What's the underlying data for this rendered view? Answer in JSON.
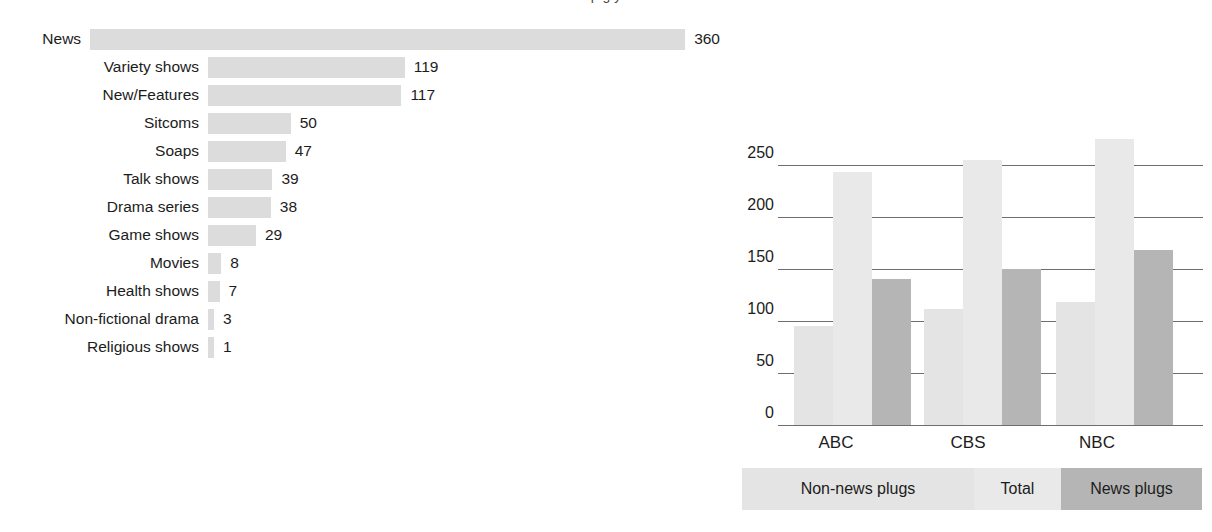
{
  "figure": {
    "cut_off_title": "p g y"
  },
  "chart_data": [
    {
      "type": "bar",
      "orientation": "horizontal",
      "title": "",
      "xlabel": "",
      "ylabel": "",
      "categories": [
        "News",
        "Variety shows",
        "New/Features",
        "Sitcoms",
        "Soaps",
        "Talk shows",
        "Drama series",
        "Game shows",
        "Movies",
        "Health shows",
        "Non-fictional drama",
        "Religious shows"
      ],
      "values": [
        360,
        119,
        117,
        50,
        47,
        39,
        38,
        29,
        8,
        7,
        3,
        1
      ],
      "value_labels": [
        "360",
        "119",
        "117",
        "50",
        "47",
        "39",
        "38",
        "29",
        "8",
        "7",
        "3",
        "1"
      ],
      "xlim": [
        0,
        360
      ],
      "grid": false,
      "bar_color": "#dcdcdc"
    },
    {
      "type": "bar",
      "orientation": "vertical",
      "grouped": true,
      "title": "",
      "xlabel": "",
      "ylabel": "",
      "categories": [
        "ABC",
        "CBS",
        "NBC"
      ],
      "series": [
        {
          "name": "Non-news plugs",
          "values": [
            95,
            112,
            118
          ],
          "color": "#e4e4e4"
        },
        {
          "name": "Total",
          "values": [
            243,
            255,
            275
          ],
          "color": "#e9e9e9"
        },
        {
          "name": "News plugs",
          "values": [
            140,
            150,
            168
          ],
          "color": "#b5b5b5"
        }
      ],
      "ylim": [
        0,
        250
      ],
      "yticks": [
        0,
        50,
        100,
        150,
        200,
        250
      ],
      "ytick_labels": [
        "0",
        "50",
        "100",
        "150",
        "200",
        "250"
      ],
      "grid": true,
      "legend_position": "bottom"
    }
  ],
  "left_chart": {
    "rows": [
      {
        "label": "News",
        "value": "360",
        "amount": 360
      },
      {
        "label": "Variety shows",
        "value": "119",
        "amount": 119
      },
      {
        "label": "New/Features",
        "value": "117",
        "amount": 117
      },
      {
        "label": "Sitcoms",
        "value": "50",
        "amount": 50
      },
      {
        "label": "Soaps",
        "value": "47",
        "amount": 47
      },
      {
        "label": "Talk shows",
        "value": "39",
        "amount": 39
      },
      {
        "label": "Drama series",
        "value": "38",
        "amount": 38
      },
      {
        "label": "Game shows",
        "value": "29",
        "amount": 29
      },
      {
        "label": "Movies",
        "value": "8",
        "amount": 8
      },
      {
        "label": "Health shows",
        "value": "7",
        "amount": 7
      },
      {
        "label": "Non-fictional drama",
        "value": "3",
        "amount": 3
      },
      {
        "label": "Religious shows",
        "value": "1",
        "amount": 1
      }
    ]
  },
  "right_chart": {
    "ytick_labels": [
      "250",
      "200",
      "150",
      "100",
      "50",
      "0"
    ],
    "xlabels": [
      "ABC",
      "CBS",
      "NBC"
    ],
    "groups": [
      {
        "name": "ABC",
        "nonnews": 95,
        "total": 243,
        "news": 140
      },
      {
        "name": "CBS",
        "nonnews": 112,
        "total": 255,
        "news": 150
      },
      {
        "name": "NBC",
        "nonnews": 118,
        "total": 275,
        "news": 168
      }
    ],
    "legend": {
      "nonnews_label": "Non-news plugs",
      "total_label": "Total",
      "news_label": "News plugs"
    },
    "colors": {
      "nonnews": "#e4e4e4",
      "total": "#e9e9e9",
      "news": "#b5b5b5",
      "gridline": "#6e6e6e"
    }
  }
}
